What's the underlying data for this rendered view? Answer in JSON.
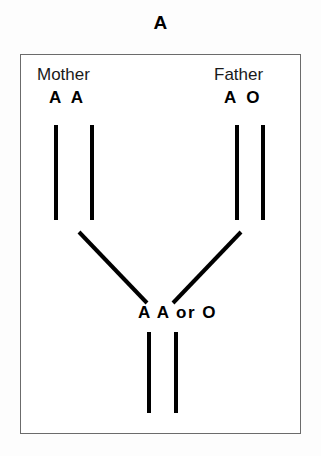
{
  "title": "A",
  "box": {
    "mother": {
      "label": "Mother",
      "alleles": "A A"
    },
    "father": {
      "label": "Father",
      "alleles": "A O"
    },
    "offspring": {
      "alleles": "A A or O"
    }
  },
  "colors": {
    "line": "#000000",
    "border": "#6b6b6b",
    "background": "#ffffff",
    "text": "#000000"
  },
  "lines": {
    "mother_left": {
      "x1": 35,
      "y1": 70,
      "x2": 35,
      "y2": 165
    },
    "mother_right": {
      "x1": 71,
      "y1": 70,
      "x2": 71,
      "y2": 165
    },
    "father_left": {
      "x1": 216,
      "y1": 70,
      "x2": 216,
      "y2": 165
    },
    "father_right": {
      "x1": 242,
      "y1": 70,
      "x2": 242,
      "y2": 165
    },
    "mother_diagonal": {
      "x1": 58,
      "y1": 177,
      "x2": 126,
      "y2": 248
    },
    "father_diagonal": {
      "x1": 220,
      "y1": 177,
      "x2": 152,
      "y2": 248
    },
    "child_left": {
      "x1": 128,
      "y1": 277,
      "x2": 128,
      "y2": 358
    },
    "child_right": {
      "x1": 155,
      "y1": 277,
      "x2": 155,
      "y2": 358
    }
  }
}
